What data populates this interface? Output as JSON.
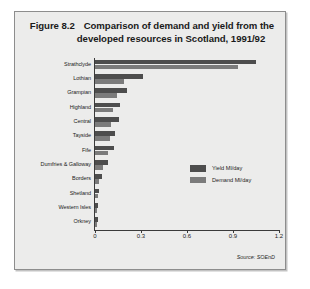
{
  "figure": {
    "number_label": "Figure 8.2",
    "title_line_1": "Comparison of demand and yield from the",
    "title_line_2": "developed resources in Scotland, 1991/92",
    "source": "Source: SOEnD"
  },
  "legend": {
    "position": "inside-right",
    "entries": [
      {
        "label": "Yield Ml/day",
        "color": "#4d4d4d",
        "swatch_name": "legend-swatch-yield"
      },
      {
        "label": "Demand Ml/day",
        "color": "#7b7b7b",
        "swatch_name": "legend-swatch-demand"
      }
    ]
  },
  "chart_data": {
    "type": "bar",
    "orientation": "horizontal",
    "title": "Comparison of demand and yield from the developed resources in Scotland, 1991/92",
    "xlabel": "",
    "ylabel": "",
    "xlim": [
      0,
      1.2
    ],
    "xticks": [
      0,
      0.3,
      0.6,
      0.9,
      1.2
    ],
    "xtick_labels": [
      "0",
      "0.3",
      "0.6",
      "0.9",
      "1.2"
    ],
    "grid": false,
    "categories": [
      "Strathclyde",
      "Lothian",
      "Grampian",
      "Highland",
      "Central",
      "Tayside",
      "Fife",
      "Dumfries & Galloway",
      "Borders",
      "Shetland",
      "Western Isles",
      "Orkney"
    ],
    "series": [
      {
        "name": "Yield Ml/day",
        "color": "#4d4d4d",
        "values": [
          1.05,
          0.31,
          0.21,
          0.16,
          0.155,
          0.13,
          0.125,
          0.085,
          0.048,
          0.025,
          0.022,
          0.018
        ]
      },
      {
        "name": "Demand Ml/day",
        "color": "#7b7b7b",
        "values": [
          0.93,
          0.19,
          0.145,
          0.12,
          0.105,
          0.1,
          0.085,
          0.055,
          0.028,
          0.018,
          0.015,
          0.012
        ]
      }
    ]
  }
}
